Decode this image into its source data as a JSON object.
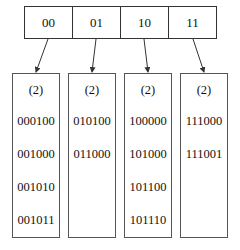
{
  "directory": {
    "entries": [
      {
        "label": "00"
      },
      {
        "label": "01"
      },
      {
        "label": "10"
      },
      {
        "label": "11"
      }
    ]
  },
  "buckets": [
    {
      "local_depth": "(2)",
      "keys": [
        "000100",
        "001000",
        "001010",
        "001011"
      ]
    },
    {
      "local_depth": "(2)",
      "keys": [
        "010100",
        "011000"
      ]
    },
    {
      "local_depth": "(2)",
      "keys": [
        "100000",
        "101000",
        "101100",
        "101110"
      ]
    },
    {
      "local_depth": "(2)",
      "keys": [
        "111000",
        "111001"
      ]
    }
  ],
  "colors": {
    "line": "#333333",
    "text": "#111111",
    "background": "#ffffff"
  }
}
